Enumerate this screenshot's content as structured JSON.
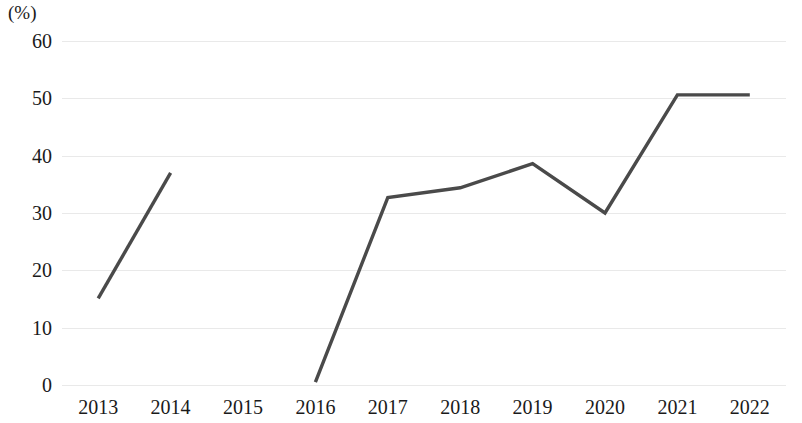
{
  "chart_data": {
    "type": "line",
    "title": "",
    "subtitle": "",
    "xlabel": "",
    "ylabel": "",
    "unit_label": "(%)",
    "categories": [
      "2013",
      "2014",
      "2015",
      "2016",
      "2017",
      "2018",
      "2019",
      "2020",
      "2021",
      "2022"
    ],
    "series": [
      {
        "name": "",
        "values": [
          15.1,
          37.0,
          null,
          0.5,
          32.7,
          34.4,
          38.6,
          30.0,
          50.6,
          50.6
        ]
      }
    ],
    "ylim": [
      0,
      60
    ],
    "ytick_labels": [
      "60",
      "50",
      "40",
      "30",
      "20",
      "10",
      "0"
    ],
    "ytick_values": [
      60,
      50,
      40,
      30,
      20,
      10,
      0
    ],
    "grid": true,
    "legend": false,
    "legend_position": "none",
    "line_color": "#4a4a4a",
    "grid_color": "#e9e9e9",
    "missing_points": [
      "2015"
    ],
    "annotations": []
  }
}
